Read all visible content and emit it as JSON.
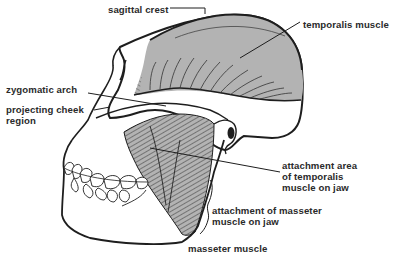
{
  "diagram": {
    "colors": {
      "muscle_fill": "#b3b3b3",
      "outline": "#1e1e1e",
      "label_text": "#2a2a2a",
      "background": "#ffffff"
    },
    "labels": [
      {
        "id": "sagittal-crest",
        "text": "sagittal crest",
        "x": 108,
        "y": 4
      },
      {
        "id": "temporalis-muscle",
        "text": "temporalis muscle",
        "x": 303,
        "y": 19
      },
      {
        "id": "zygomatic-arch",
        "text": "zygomatic arch",
        "x": 6,
        "y": 84
      },
      {
        "id": "projecting-cheek-region",
        "text": "projecting cheek\nregion",
        "x": 6,
        "y": 104
      },
      {
        "id": "attachment-temporalis",
        "text": "attachment area\nof temporalis\nmuscle on jaw",
        "x": 282,
        "y": 157
      },
      {
        "id": "attachment-masseter",
        "text": "attachment of masseter\nmuscle on jaw",
        "x": 212,
        "y": 205
      },
      {
        "id": "masseter-muscle",
        "text": "masseter muscle",
        "x": 188,
        "y": 243
      }
    ]
  }
}
